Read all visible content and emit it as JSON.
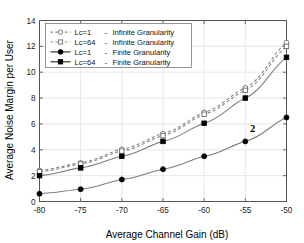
{
  "chart_data": {
    "type": "line",
    "title": "",
    "xlabel": "Average Channel Gain (dB)",
    "ylabel": "Average Noise Margin per User",
    "xlim": [
      -80,
      -50
    ],
    "ylim": [
      0,
      14
    ],
    "xticks": [
      -80,
      -75,
      -70,
      -65,
      -60,
      -55,
      -50
    ],
    "yticks": [
      0,
      2,
      4,
      6,
      8,
      10,
      12,
      14
    ],
    "xtick_labels": [
      "-80",
      "-75",
      "-70",
      "-65",
      "-60",
      "-55",
      "-50"
    ],
    "ytick_labels": [
      "0",
      "2",
      "4",
      "6",
      "8",
      "10",
      "12",
      "14"
    ],
    "grid": true,
    "legend_position": "upper-left",
    "x": [
      -80,
      -75,
      -70,
      -65,
      -60,
      -55,
      -50
    ],
    "series": [
      {
        "name": "Lc=1  - Infinite Granularity",
        "label_lc": "Lc=1",
        "label_gran": "Infinite Granularity",
        "marker": "open-circle",
        "linestyle": "dashed",
        "color": "#8c8c8c",
        "values": [
          2.4,
          3.0,
          4.05,
          5.25,
          6.9,
          8.8,
          12.3
        ]
      },
      {
        "name": "Lc=64 - Infinite Granularity",
        "label_lc": "Lc=64",
        "label_gran": "Infinite Granularity",
        "marker": "open-square",
        "linestyle": "dashed",
        "color": "#8c8c8c",
        "values": [
          2.3,
          2.9,
          3.9,
          5.1,
          6.75,
          8.6,
          12.0
        ]
      },
      {
        "name": "Lc=1  - Finite Granularity",
        "label_lc": "Lc=1",
        "label_gran": "Finite Granularity",
        "marker": "filled-circle",
        "linestyle": "solid",
        "color": "#000000",
        "values": [
          0.6,
          0.95,
          1.7,
          2.5,
          3.5,
          4.65,
          6.5
        ]
      },
      {
        "name": "Lc=64 - Finite Granularity",
        "label_lc": "Lc=64",
        "label_gran": "Finite Granularity",
        "marker": "filled-square",
        "linestyle": "solid",
        "color": "#000000",
        "values": [
          2.0,
          2.6,
          3.5,
          4.65,
          6.05,
          8.0,
          11.15
        ]
      }
    ],
    "annotations": [
      {
        "text": "2",
        "x": -54.1,
        "y": 5.35
      }
    ]
  },
  "legend": {
    "entries": [
      {
        "lc": "Lc=1",
        "dash": "-",
        "gran": "Infinite Granularity"
      },
      {
        "lc": "Lc=64",
        "dash": "-",
        "gran": "Infinite Granularity"
      },
      {
        "lc": "Lc=1",
        "dash": "-",
        "gran": "Finite Granularity"
      },
      {
        "lc": "Lc=64",
        "dash": "-",
        "gran": "Finite Granularity"
      }
    ]
  },
  "colors": {
    "axis": "#555555",
    "grid": "#d8d8d8",
    "dashed_series": "#8c8c8c",
    "solid_series": "#000000",
    "background": "#ffffff"
  }
}
